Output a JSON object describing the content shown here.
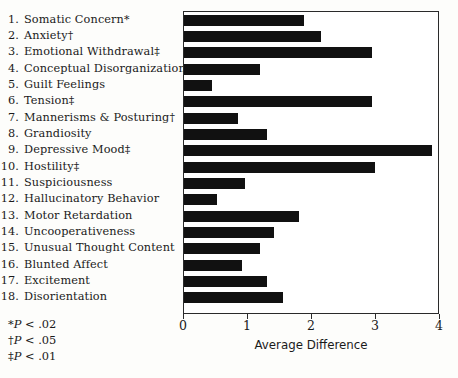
{
  "chart_data": {
    "type": "bar",
    "orientation": "horizontal",
    "title": "",
    "xlabel": "Average Difference",
    "ylabel": "",
    "xlim": [
      0,
      4
    ],
    "xticks": [
      "0",
      "1",
      "2",
      "3",
      "4"
    ],
    "grid": false,
    "legend": null,
    "bar_color": "#111111",
    "categories": [
      "Somatic Concern",
      "Anxiety",
      "Emotional Withdrawal",
      "Conceptual Disorganization",
      "Guilt Feelings",
      "Tension",
      "Mannerisms & Posturing",
      "Grandiosity",
      "Depressive Mood",
      "Hostility",
      "Suspiciousness",
      "Hallucinatory Behavior",
      "Motor Retardation",
      "Uncooperativeness",
      "Unusual Thought Content",
      "Blunted Affect",
      "Excitement",
      "Disorientation"
    ],
    "values": [
      1.87,
      2.14,
      2.93,
      1.18,
      0.44,
      2.94,
      0.84,
      1.29,
      3.87,
      2.98,
      0.95,
      0.52,
      1.8,
      1.41,
      1.18,
      0.91,
      1.3,
      1.54
    ],
    "significance_markers": [
      "*",
      "†",
      "‡",
      "",
      "",
      "‡",
      "†",
      "",
      "‡",
      "‡",
      "",
      "",
      "",
      "",
      "",
      "",
      "",
      ""
    ],
    "numbers": [
      "1.",
      "2.",
      "3.",
      "4.",
      "5.",
      "6.",
      "7.",
      "8.",
      "9.",
      "10.",
      "11.",
      "12.",
      "13.",
      "14.",
      "15.",
      "16.",
      "17.",
      "18."
    ]
  },
  "footnotes": [
    {
      "marker": "*",
      "p": "P",
      "text": " < .02"
    },
    {
      "marker": "†",
      "p": "P",
      "text": " < .05"
    },
    {
      "marker": "‡",
      "p": "P",
      "text": " < .01"
    }
  ]
}
